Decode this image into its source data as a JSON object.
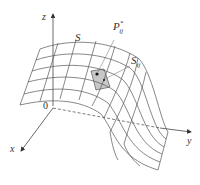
{
  "diagram": {
    "labels": {
      "z_axis": "z",
      "x_axis": "x",
      "y_axis": "y",
      "origin": "0",
      "surface": "S",
      "point_base": "P",
      "point_sup": "*",
      "point_sub": "ij",
      "patch_base": "S",
      "patch_sub": "ij"
    },
    "colors": {
      "line": "#555555",
      "patch_fill": "#c8c8c8",
      "text": "#333333"
    },
    "grid": {
      "rows": 5,
      "cols": 7
    }
  }
}
